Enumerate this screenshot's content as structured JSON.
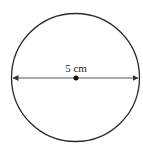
{
  "diagram": {
    "shape": "circle",
    "diameter_label": "5 cm",
    "center_point": true,
    "diameter_line": "double-headed arrow across center",
    "colors": {
      "stroke": "#2a2a2a",
      "line": "#555555",
      "background": "#ffffff"
    }
  }
}
